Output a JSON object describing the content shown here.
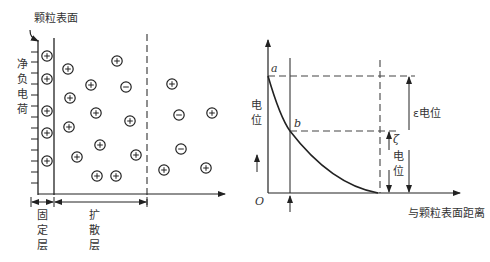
{
  "left_panel": {
    "surface_label": "颗粒表面",
    "net_charge_label": "净负电荷",
    "fixed_layer_label": "固定层",
    "diffuse_layer_label": "扩散层",
    "ions": [
      {
        "x": 47,
        "y": 56,
        "sign": "+"
      },
      {
        "x": 47,
        "y": 79,
        "sign": "+"
      },
      {
        "x": 47,
        "y": 111,
        "sign": "+"
      },
      {
        "x": 47,
        "y": 133,
        "sign": "+"
      },
      {
        "x": 47,
        "y": 161,
        "sign": "+"
      },
      {
        "x": 68,
        "y": 69,
        "sign": "+"
      },
      {
        "x": 70,
        "y": 98,
        "sign": "+"
      },
      {
        "x": 69,
        "y": 127,
        "sign": "+"
      },
      {
        "x": 77,
        "y": 157,
        "sign": "+"
      },
      {
        "x": 91,
        "y": 85,
        "sign": "+"
      },
      {
        "x": 96,
        "y": 113,
        "sign": "+"
      },
      {
        "x": 100,
        "y": 145,
        "sign": "+"
      },
      {
        "x": 97,
        "y": 176,
        "sign": "+"
      },
      {
        "x": 117,
        "y": 61,
        "sign": "+"
      },
      {
        "x": 126,
        "y": 87,
        "sign": "-"
      },
      {
        "x": 130,
        "y": 121,
        "sign": "+"
      },
      {
        "x": 116,
        "y": 176,
        "sign": "+"
      },
      {
        "x": 136,
        "y": 155,
        "sign": "+"
      },
      {
        "x": 172,
        "y": 84,
        "sign": "+"
      },
      {
        "x": 179,
        "y": 115,
        "sign": "-"
      },
      {
        "x": 212,
        "y": 113,
        "sign": "+"
      },
      {
        "x": 181,
        "y": 149,
        "sign": "-"
      },
      {
        "x": 164,
        "y": 170,
        "sign": "+"
      },
      {
        "x": 206,
        "y": 168,
        "sign": "+"
      }
    ]
  },
  "right_panel": {
    "y_axis_label": "电位",
    "origin_label": "O",
    "point_a": "a",
    "point_b": "b",
    "epsilon_label": "ε电位",
    "zeta_symbol": "ζ",
    "zeta_label": "电位",
    "x_axis_label": "与颗粒表面距离"
  }
}
